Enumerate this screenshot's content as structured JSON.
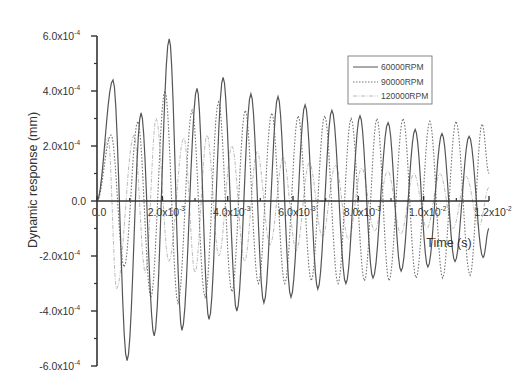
{
  "chart_data": {
    "type": "line",
    "title": "",
    "xlabel": "Time (s)",
    "ylabel": "Dynamic response (mm)",
    "xlim": [
      0,
      0.012
    ],
    "ylim": [
      -0.0006,
      0.0006
    ],
    "grid": false,
    "legend_position": "upper-right-inside",
    "x_ticks": [
      {
        "value": 0,
        "label": "0.0"
      },
      {
        "value": 0.002,
        "label": "2.0x10",
        "exp": "-3"
      },
      {
        "value": 0.004,
        "label": "4.0x10",
        "exp": "-3"
      },
      {
        "value": 0.006,
        "label": "6.0x10",
        "exp": "-3"
      },
      {
        "value": 0.008,
        "label": "8.0x10",
        "exp": "-3"
      },
      {
        "value": 0.01,
        "label": "1.0x10",
        "exp": "-2"
      },
      {
        "value": 0.012,
        "label": "1.2x10",
        "exp": "-2"
      }
    ],
    "y_ticks": [
      {
        "value": 0.0006,
        "label": "6.0x10",
        "exp": "-4"
      },
      {
        "value": 0.0004,
        "label": "4.0x10",
        "exp": "-4"
      },
      {
        "value": 0.0002,
        "label": "2.0x10",
        "exp": "-4"
      },
      {
        "value": 0,
        "label": "0.0",
        "exp": ""
      },
      {
        "value": -0.0002,
        "label": "-2.0x10",
        "exp": "-4"
      },
      {
        "value": -0.0004,
        "label": "-4.0x10",
        "exp": "-4"
      },
      {
        "value": -0.0006,
        "label": "-6.0x10",
        "exp": "-4"
      }
    ],
    "series": [
      {
        "name": "60000RPM",
        "style": "solid",
        "color": "#555555",
        "extrema": [
          [
            0.0,
            0.0
          ],
          [
            0.00049,
            0.00044
          ],
          [
            0.00092,
            -0.00058
          ],
          [
            0.00135,
            0.00032
          ],
          [
            0.00175,
            -0.00049
          ],
          [
            0.00221,
            0.00059
          ],
          [
            0.0026,
            -0.00047
          ],
          [
            0.00306,
            0.00041
          ],
          [
            0.00343,
            -0.00043
          ],
          [
            0.00386,
            0.00045
          ],
          [
            0.00428,
            -0.0004
          ],
          [
            0.00471,
            0.00039
          ],
          [
            0.00511,
            -0.00037
          ],
          [
            0.00554,
            0.00038
          ],
          [
            0.00594,
            -0.00035
          ],
          [
            0.00637,
            0.00035
          ],
          [
            0.00676,
            -0.00032
          ],
          [
            0.00719,
            0.00033
          ],
          [
            0.00762,
            -0.0003
          ],
          [
            0.00805,
            0.00031
          ],
          [
            0.00845,
            -0.00028
          ],
          [
            0.00891,
            0.000285
          ],
          [
            0.00931,
            -0.000255
          ],
          [
            0.00974,
            0.00026
          ],
          [
            0.01013,
            -0.00024
          ],
          [
            0.01056,
            0.000245
          ],
          [
            0.01096,
            -0.00022
          ],
          [
            0.01139,
            0.000235
          ],
          [
            0.01182,
            -0.000205
          ],
          [
            0.012,
            -0.0001
          ]
        ]
      },
      {
        "name": "90000RPM",
        "style": "dotted",
        "color": "#777777",
        "extrema": [
          [
            0.0,
            0.0
          ],
          [
            0.00043,
            0.00024
          ],
          [
            0.00083,
            -0.00024
          ],
          [
            0.00125,
            0.00029
          ],
          [
            0.00165,
            -0.00035
          ],
          [
            0.00208,
            0.0004
          ],
          [
            0.00248,
            -0.00037
          ],
          [
            0.00291,
            0.00033
          ],
          [
            0.00331,
            -0.00035
          ],
          [
            0.00372,
            0.00036
          ],
          [
            0.00413,
            -0.00033
          ],
          [
            0.00454,
            0.00033
          ],
          [
            0.00494,
            -0.0003
          ],
          [
            0.00535,
            0.00032
          ],
          [
            0.00575,
            -0.0003
          ],
          [
            0.00616,
            0.00031
          ],
          [
            0.00656,
            -0.00029
          ],
          [
            0.00697,
            0.00031
          ],
          [
            0.00738,
            -0.0003
          ],
          [
            0.00778,
            0.0003
          ],
          [
            0.00819,
            -0.00029
          ],
          [
            0.00857,
            0.0003
          ],
          [
            0.00894,
            -0.00029
          ],
          [
            0.00937,
            0.0003
          ],
          [
            0.00977,
            -0.00028
          ],
          [
            0.01019,
            0.00029
          ],
          [
            0.01058,
            -0.00028
          ],
          [
            0.01099,
            0.00029
          ],
          [
            0.01142,
            -0.00027
          ],
          [
            0.01179,
            0.00028
          ],
          [
            0.012,
            0.0001
          ]
        ]
      },
      {
        "name": "120000RPM",
        "style": "dash-dot",
        "color": "#bbbbbb",
        "extrema": [
          [
            0.0,
            0.0
          ],
          [
            0.00034,
            0.00023
          ],
          [
            0.0006,
            -0.00032
          ],
          [
            0.00113,
            0.00024
          ],
          [
            0.00148,
            -0.00026
          ],
          [
            0.00181,
            0.0003
          ],
          [
            0.0022,
            -0.00022
          ],
          [
            0.00266,
            0.00023
          ],
          [
            0.003,
            -0.00026
          ],
          [
            0.00337,
            0.00024
          ],
          [
            0.00373,
            -0.0002
          ],
          [
            0.00413,
            0.0002
          ],
          [
            0.00452,
            -0.00022
          ],
          [
            0.0049,
            0.00018
          ],
          [
            0.0053,
            -0.00016
          ],
          [
            0.0057,
            0.00016
          ],
          [
            0.0061,
            -0.00018
          ],
          [
            0.0065,
            0.00014
          ],
          [
            0.0069,
            -0.00013
          ],
          [
            0.0073,
            0.00013
          ],
          [
            0.0077,
            -0.00014
          ],
          [
            0.0081,
            0.00012
          ],
          [
            0.0085,
            -0.00011
          ],
          [
            0.0089,
            0.00011
          ],
          [
            0.0093,
            -0.00012
          ],
          [
            0.0097,
            0.0001
          ],
          [
            0.0101,
            -0.0001
          ],
          [
            0.0105,
            0.0001
          ],
          [
            0.0109,
            -0.0001
          ],
          [
            0.0113,
            9e-05
          ],
          [
            0.0117,
            -9e-05
          ],
          [
            0.012,
            5e-05
          ]
        ]
      }
    ]
  },
  "axes": {
    "x_title": "Time (s)",
    "y_title": "Dynamic response (mm)"
  },
  "legend": {
    "items": [
      {
        "label": "60000RPM"
      },
      {
        "label": "90000RPM"
      },
      {
        "label": "120000RPM"
      }
    ]
  }
}
